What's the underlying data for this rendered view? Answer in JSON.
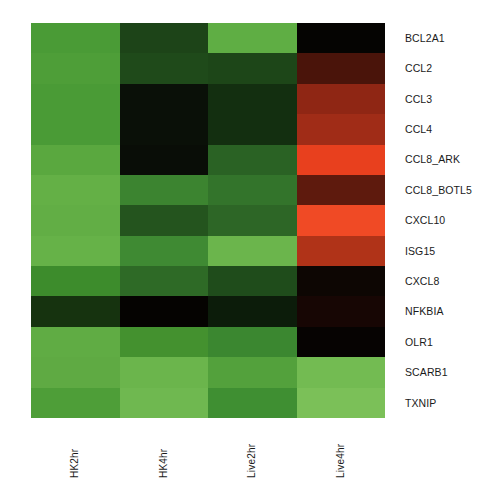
{
  "chart_data": {
    "type": "heatmap",
    "title": "",
    "xlabel": "",
    "ylabel": "",
    "grid": false,
    "legend_position": "none",
    "colormap": {
      "name": "green-black-red",
      "low_color": "#3aa037",
      "mid_color": "#0a0a06",
      "high_color": "#f04a25",
      "description": "Green = low expression, black = mid, red = high expression"
    },
    "columns": [
      "HK2hr",
      "HK4hr",
      "Live2hr",
      "Live4hr"
    ],
    "rows": [
      "BCL2A1",
      "CCL2",
      "CCL3",
      "CCL4",
      "CCL8_ARK",
      "CCL8_BOTL5",
      "CXCL10",
      "ISG15",
      "CXCL8",
      "NFKBIA",
      "OLR1",
      "SCARB1",
      "TXNIP"
    ],
    "values": [
      [
        -1.05,
        -1.95,
        -0.7,
        2.95
      ],
      [
        -1.0,
        -1.75,
        -1.8,
        1.75
      ],
      [
        -1.05,
        -2.7,
        -2.35,
        1.35
      ],
      [
        -1.05,
        -2.7,
        -2.35,
        1.15
      ],
      [
        -0.7,
        -2.8,
        -1.6,
        2.15
      ],
      [
        -0.55,
        -1.35,
        -1.45,
        1.55
      ],
      [
        -0.6,
        -1.8,
        -1.3,
        2.2
      ],
      [
        -0.55,
        -1.15,
        -0.7,
        1.6
      ],
      [
        -1.3,
        -1.45,
        -1.85,
        2.85
      ],
      [
        -1.9,
        -2.75,
        -2.3,
        2.6
      ],
      [
        -0.7,
        -1.25,
        -1.3,
        2.95
      ],
      [
        -0.7,
        -0.55,
        -0.8,
        -0.6
      ],
      [
        -1.1,
        -0.55,
        -1.05,
        -0.5
      ]
    ],
    "cell_colors": [
      [
        "#4a9b36",
        "#1d4418",
        "#5fae44",
        "#050402"
      ],
      [
        "#4e9e38",
        "#1f4a1a",
        "#1d4618",
        "#4a140a"
      ],
      [
        "#4a9b36",
        "#0a1008",
        "#132f10",
        "#8f2614"
      ],
      [
        "#4a9b36",
        "#0a1008",
        "#132f10",
        "#a02c17"
      ],
      [
        "#5aa83f",
        "#090d07",
        "#2a6224",
        "#e8401e"
      ],
      [
        "#64b046",
        "#3c8430",
        "#33742b",
        "#5e1a0d"
      ],
      [
        "#62ae45",
        "#24541e",
        "#2d6626",
        "#f04a25"
      ],
      [
        "#66b248",
        "#3f8a33",
        "#6bb54c",
        "#b03318"
      ],
      [
        "#3d8c2c",
        "#2e6a26",
        "#1f4c1b",
        "#0d0603"
      ],
      [
        "#16330f",
        "#050301",
        "#0c1c0a",
        "#170604"
      ],
      [
        "#60ac44",
        "#44912f",
        "#3b8730",
        "#060302"
      ],
      [
        "#5faa43",
        "#6bb54c",
        "#53a13c",
        "#73bb52"
      ],
      [
        "#4e9e38",
        "#6fb850",
        "#3f8f32",
        "#7bc058"
      ]
    ]
  },
  "row_labels": [
    "BCL2A1",
    "CCL2",
    "CCL3",
    "CCL4",
    "CCL8_ARK",
    "CCL8_BOTL5",
    "CXCL10",
    "ISG15",
    "CXCL8",
    "NFKBIA",
    "OLR1",
    "SCARB1",
    "TXNIP"
  ],
  "column_labels": [
    "HK2hr",
    "HK4hr",
    "Live2hr",
    "Live4hr"
  ]
}
